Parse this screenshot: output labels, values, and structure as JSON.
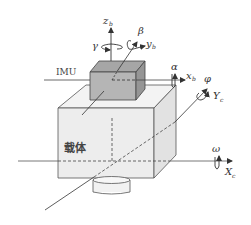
{
  "diagram": {
    "title": "",
    "labels": {
      "imu": "IMU",
      "carrier": "载体",
      "zb": "z",
      "zb_sub": "b",
      "yb": "y",
      "yb_sub": "b",
      "xb": "x",
      "xb_sub": "b",
      "Yc": "Y",
      "Yc_sub": "c",
      "Xc": "X",
      "Xc_sub": "c",
      "gamma": "γ",
      "beta": "β",
      "alpha": "α",
      "phi": "φ",
      "omega": "ω"
    },
    "colors": {
      "line": "#333333",
      "imu_front": "#b3b3b3",
      "imu_top": "#a0a0a0",
      "imu_side": "#8f8f8f",
      "body_front": "#ededed",
      "body_top": "#f3f3f3",
      "body_side": "#e2e2e2"
    }
  }
}
